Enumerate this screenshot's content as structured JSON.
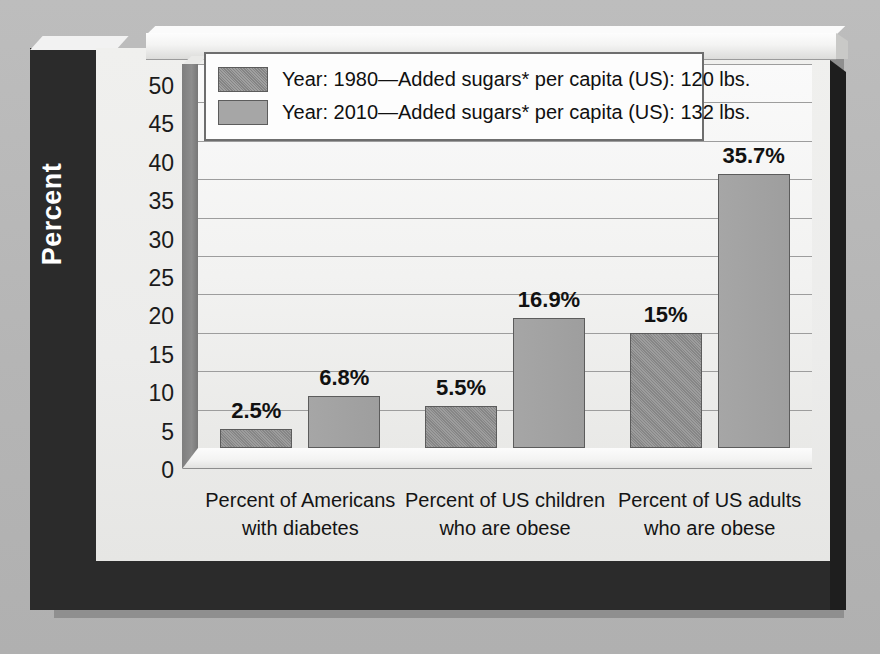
{
  "chart_data": {
    "type": "bar",
    "title": "",
    "xlabel": "",
    "ylabel": "Percent",
    "ylim": [
      0,
      50
    ],
    "ytick_step": 5,
    "yticks": [
      "50",
      "45",
      "40",
      "35",
      "30",
      "25",
      "20",
      "15",
      "10",
      "5",
      "0"
    ],
    "grid": true,
    "legend_position": "top-center",
    "categories": [
      "Percent of Americans with diabetes",
      "Percent of US children who are obese",
      "Percent of US adults who are obese"
    ],
    "category_lines": [
      [
        "Percent of Americans",
        "with diabetes"
      ],
      [
        "Percent of US children",
        "who are obese"
      ],
      [
        "Percent of US adults",
        "who are obese"
      ]
    ],
    "series": [
      {
        "name": "Year: 1980—Added sugars* per capita (US): 120 lbs.",
        "year": "1980",
        "added_sugars_per_capita_lbs": 120,
        "color": "#8e8e8e",
        "values": [
          2.5,
          5.5,
          15
        ],
        "labels": [
          "2.5%",
          "5.5%",
          "15%"
        ]
      },
      {
        "name": "Year: 2010—Added sugars* per capita (US): 132 lbs.",
        "year": "2010",
        "added_sugars_per_capita_lbs": 132,
        "color": "#a6a6a6",
        "values": [
          6.8,
          16.9,
          35.7
        ],
        "labels": [
          "6.8%",
          "16.9%",
          "35.7%"
        ]
      }
    ]
  },
  "legend": {
    "items": [
      {
        "label": "Year: 1980—Added sugars* per capita (US): 120 lbs.",
        "swatch": "legend-swatch-1980"
      },
      {
        "label": "Year: 2010—Added sugars* per capita (US): 132 lbs.",
        "swatch": "legend-swatch-2010"
      }
    ]
  },
  "axis": {
    "y_title": "Percent"
  },
  "colors": {
    "page_background": "#b9b9b9",
    "frame_dark": "#2b2b2b",
    "card_background": "#efefed",
    "plot_background": "#f6f6f5",
    "gridline": "#9d9d9d",
    "series_1980": "#8e8e8e",
    "series_2010": "#a6a6a6",
    "bar_outline": "#5c5c5c",
    "y_title_text": "#ffffff",
    "text": "#111111"
  }
}
